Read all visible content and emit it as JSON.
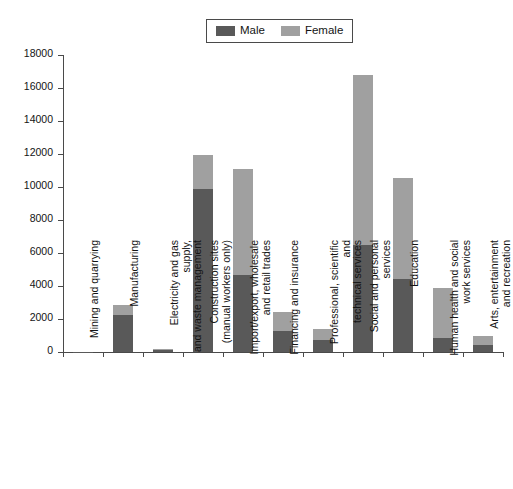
{
  "chart_data": {
    "type": "bar",
    "subtype": "stacked-vertical",
    "title": "",
    "xlabel": "",
    "ylabel": "",
    "ylim": [
      0,
      18000
    ],
    "ytick_step": 2000,
    "yticks": [
      "18000",
      "16000",
      "14000",
      "12000",
      "10000",
      "8000",
      "6000",
      "4000",
      "2000",
      "0"
    ],
    "grid": false,
    "legend_position": "top-center",
    "categories": [
      "Mining and quarrying",
      "Manufacturing",
      "Electricity and gas supply,\nand waste management",
      "Construction sites\n(manual workers only)",
      "Import/export, wholesale\nand retail trades",
      "Financing and insurance",
      "Professional, scientific and\ntechnical services",
      "Social and personal\nservices",
      "Education",
      "Human health and social\nwork services",
      "Arts, entertainment\nand recreation"
    ],
    "series": [
      {
        "name": "Male",
        "color": "#595959",
        "values": [
          20,
          2250,
          130,
          9900,
          4650,
          1300,
          750,
          6500,
          4400,
          850,
          420
        ]
      },
      {
        "name": "Female",
        "color": "#a0a0a0",
        "values": [
          5,
          600,
          30,
          2050,
          6450,
          1100,
          650,
          10300,
          6150,
          3000,
          580
        ]
      }
    ],
    "totals": [
      25,
      2850,
      160,
      11950,
      11100,
      2400,
      1400,
      16800,
      10550,
      3850,
      1000
    ]
  },
  "legend": {
    "entries": [
      {
        "label": "Male",
        "color": "#595959"
      },
      {
        "label": "Female",
        "color": "#a0a0a0"
      }
    ]
  }
}
